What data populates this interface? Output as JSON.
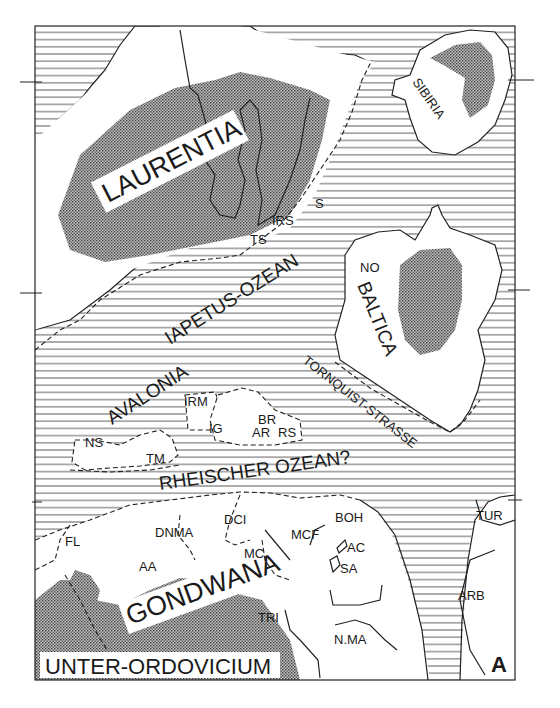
{
  "map": {
    "title": "UNTER-ORDOVICIUM",
    "panel_label": "A",
    "colors": {
      "ocean_hatch": "#333333",
      "land": "#ffffff",
      "shield_stipple": "#555555",
      "frame": "#222222"
    },
    "continents": {
      "laurentia": "LAURENTIA",
      "sibiria": "SIBIRIA",
      "baltica": "BALTICA",
      "avalonia": "AVALONIA",
      "gondwana": "GONDWANA"
    },
    "oceans": {
      "iapetus": "IAPETUS-OZEAN",
      "rheic": "RHEISCHER OZEAN?",
      "tornquist": "TORNQUIST-STRASSE"
    },
    "terranes": {
      "irs": "IRS",
      "s": "S",
      "ts": "TS",
      "no": "NO",
      "irm": "IRM",
      "ig": "IG",
      "br": "BR",
      "ar": "AR",
      "rs": "RS",
      "ns": "NS",
      "tm": "TM",
      "fl": "FL",
      "dnma": "DNMA",
      "aa": "AA",
      "dci": "DCI",
      "mc": "MC",
      "mcf": "MCF",
      "boh": "BOH",
      "ac": "AC",
      "sa": "SA",
      "tri": "TRI",
      "nma": "N.MA",
      "tur": "TUR",
      "arb": "ARB"
    },
    "legend": {
      "hatched": "ocean",
      "white": "continental crust",
      "stippled": "exposed shield"
    }
  }
}
